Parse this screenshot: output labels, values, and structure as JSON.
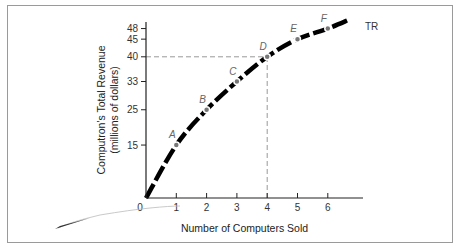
{
  "chart_data": {
    "type": "line",
    "title": "",
    "xlabel": "Number of Computers Sold",
    "ylabel": "Computron's Total Revenue (millions of dollars)",
    "ylabel_lines": [
      "Computron's Total Revenue",
      "(millions of dollars)"
    ],
    "x_ticks": [
      0,
      1,
      2,
      3,
      4,
      5,
      6
    ],
    "y_ticks": [
      15,
      25,
      33,
      40,
      45,
      48
    ],
    "xlim": [
      0,
      7
    ],
    "ylim": [
      0,
      52
    ],
    "grid": false,
    "series": [
      {
        "name": "TR",
        "x": [
          0,
          1,
          2,
          3,
          4,
          5,
          6
        ],
        "values": [
          0,
          15,
          25,
          33,
          40,
          45,
          48
        ],
        "style": "thick dashed black"
      }
    ],
    "points": [
      {
        "label": "A",
        "x": 1,
        "y": 15
      },
      {
        "label": "B",
        "x": 2,
        "y": 25
      },
      {
        "label": "C",
        "x": 3,
        "y": 33
      },
      {
        "label": "D",
        "x": 4,
        "y": 40
      },
      {
        "label": "E",
        "x": 5,
        "y": 45
      },
      {
        "label": "F",
        "x": 6,
        "y": 48
      }
    ],
    "reference_lines": [
      {
        "type": "dashed",
        "from": [
          0,
          40
        ],
        "to": [
          4,
          40
        ]
      },
      {
        "type": "dashed",
        "from": [
          4,
          0
        ],
        "to": [
          4,
          40
        ]
      }
    ],
    "curve_label": "TR"
  },
  "colors": {
    "curve": "#000000",
    "points": "#777777",
    "guides": "#999999",
    "axis": "#222222"
  }
}
